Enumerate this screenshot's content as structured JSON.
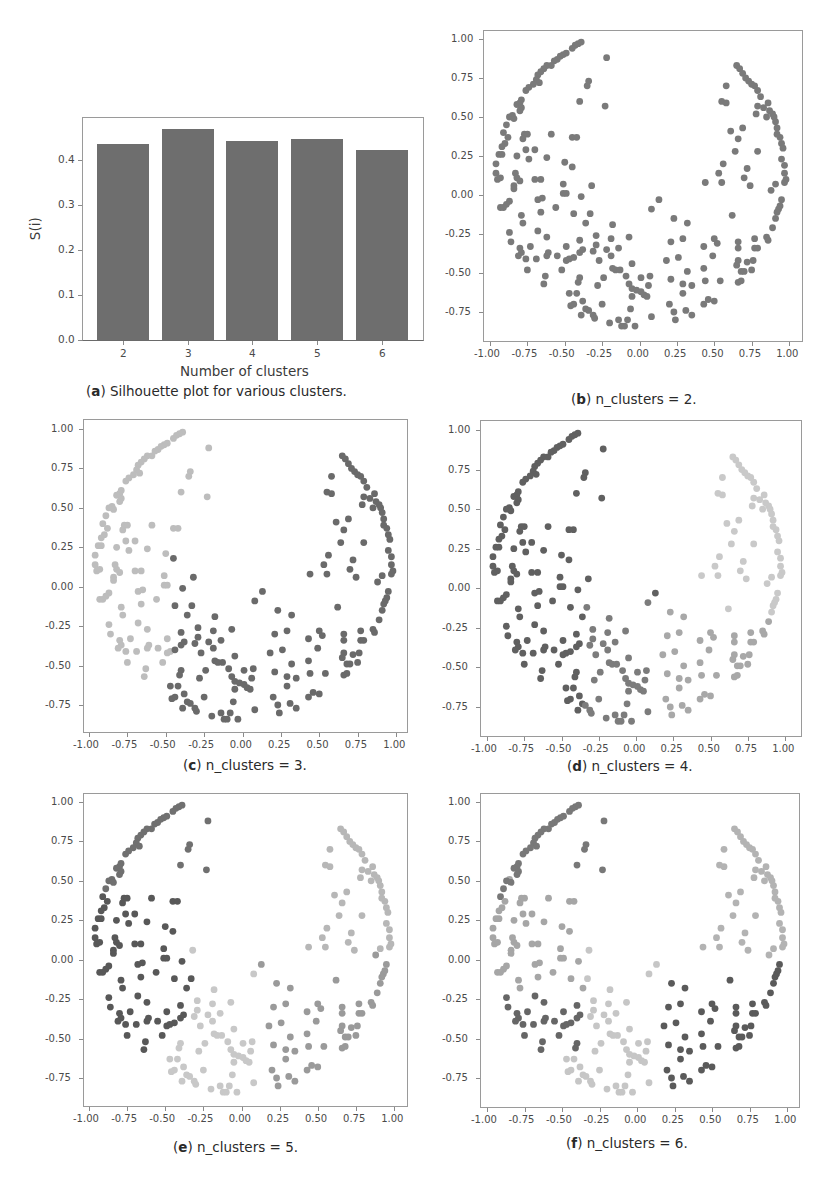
{
  "panels": {
    "a": {
      "letter": "a",
      "caption": "Silhouette plot for various clusters.",
      "ylabel": "S(i)",
      "xlabel": "Number of clusters",
      "yticks": [
        "0.0",
        "0.1",
        "0.2",
        "0.3",
        "0.4"
      ],
      "xticks": [
        "2",
        "3",
        "4",
        "5",
        "6"
      ]
    },
    "b": {
      "letter": "b",
      "caption": "n_clusters = 2."
    },
    "c": {
      "letter": "c",
      "caption": "n_clusters = 3."
    },
    "d": {
      "letter": "d",
      "caption": "n_clusters = 4."
    },
    "e": {
      "letter": "e",
      "caption": "n_clusters = 5."
    },
    "f": {
      "letter": "f",
      "caption": "n_clusters = 6."
    }
  },
  "scatter_ticks": {
    "x": [
      "-1.00",
      "-0.75",
      "-0.50",
      "-0.25",
      "0.00",
      "0.25",
      "0.50",
      "0.75",
      "1.00"
    ],
    "y": [
      "-0.75",
      "-0.50",
      "-0.25",
      "0.00",
      "0.25",
      "0.50",
      "0.75",
      "1.00"
    ]
  },
  "chart_data": [
    {
      "type": "bar",
      "title": "(a) Silhouette plot for various clusters.",
      "categories": [
        "2",
        "3",
        "4",
        "5",
        "6"
      ],
      "values": [
        0.435,
        0.47,
        0.443,
        0.447,
        0.423
      ],
      "xlabel": "Number of clusters",
      "ylabel": "S(i)",
      "ylim": [
        0,
        0.49
      ],
      "color": "#6e6e6e",
      "grid": false
    },
    {
      "type": "scatter",
      "title": "Cluster assignments of crescent-shaped dataset",
      "xlabel": "",
      "ylabel": "",
      "xlim": [
        -1.05,
        1.05
      ],
      "ylim": [
        -0.93,
        1.05
      ],
      "grid": false,
      "points": [
        [
          -0.39,
          0.98
        ],
        [
          -0.41,
          0.97
        ],
        [
          -0.43,
          0.96
        ],
        [
          -0.45,
          0.94
        ],
        [
          -0.49,
          0.91
        ],
        [
          -0.51,
          0.9
        ],
        [
          -0.53,
          0.89
        ],
        [
          -0.55,
          0.87
        ],
        [
          -0.57,
          0.86
        ],
        [
          -0.59,
          0.83
        ],
        [
          -0.62,
          0.83
        ],
        [
          -0.64,
          0.81
        ],
        [
          -0.66,
          0.79
        ],
        [
          -0.68,
          0.77
        ],
        [
          -0.69,
          0.74
        ],
        [
          -0.67,
          0.72
        ],
        [
          -0.71,
          0.71
        ],
        [
          -0.74,
          0.69
        ],
        [
          -0.76,
          0.67
        ],
        [
          -0.79,
          0.61
        ],
        [
          -0.8,
          0.59
        ],
        [
          -0.82,
          0.58
        ],
        [
          -0.79,
          0.56
        ],
        [
          -0.8,
          0.54
        ],
        [
          -0.85,
          0.51
        ],
        [
          -0.87,
          0.5
        ],
        [
          -0.84,
          0.49
        ],
        [
          -0.89,
          0.45
        ],
        [
          -0.91,
          0.4
        ],
        [
          -0.88,
          0.37
        ],
        [
          -0.9,
          0.33
        ],
        [
          -0.92,
          0.31
        ],
        [
          -0.94,
          0.26
        ],
        [
          -0.92,
          0.26
        ],
        [
          -0.96,
          0.2
        ],
        [
          -0.96,
          0.14
        ],
        [
          -0.95,
          0.1
        ],
        [
          -0.93,
          0.11
        ],
        [
          -0.34,
          0.73
        ],
        [
          -0.35,
          0.7
        ],
        [
          -0.4,
          0.6
        ],
        [
          -0.22,
          0.88
        ],
        [
          -0.23,
          0.57
        ],
        [
          -0.77,
          0.39
        ],
        [
          -0.75,
          0.39
        ],
        [
          -0.78,
          0.36
        ],
        [
          -0.59,
          0.39
        ],
        [
          -0.45,
          0.37
        ],
        [
          -0.42,
          0.37
        ],
        [
          -0.82,
          0.25
        ],
        [
          -0.76,
          0.29
        ],
        [
          -0.7,
          0.29
        ],
        [
          -0.74,
          0.23
        ],
        [
          -0.62,
          0.24
        ],
        [
          -0.5,
          0.21
        ],
        [
          -0.45,
          0.18
        ],
        [
          -0.83,
          0.14
        ],
        [
          -0.82,
          0.11
        ],
        [
          -0.8,
          0.09
        ],
        [
          -0.84,
          0.06
        ],
        [
          -0.7,
          0.1
        ],
        [
          -0.66,
          0.1
        ],
        [
          -0.51,
          0.07
        ],
        [
          -0.32,
          0.06
        ],
        [
          -0.84,
          0.04
        ],
        [
          -0.51,
          0.01
        ],
        [
          -0.49,
          0.01
        ],
        [
          -0.39,
          -0.01
        ],
        [
          -0.68,
          -0.03
        ],
        [
          -0.65,
          -0.02
        ],
        [
          -0.87,
          -0.04
        ],
        [
          -0.89,
          -0.06
        ],
        [
          -0.93,
          -0.08
        ],
        [
          -0.91,
          -0.08
        ],
        [
          -0.66,
          -0.11
        ],
        [
          -0.56,
          -0.08
        ],
        [
          -0.44,
          -0.12
        ],
        [
          -0.79,
          -0.13
        ],
        [
          -0.78,
          -0.18
        ],
        [
          -0.33,
          -0.12
        ],
        [
          -0.36,
          -0.18
        ],
        [
          -0.87,
          -0.24
        ],
        [
          -0.68,
          -0.23
        ],
        [
          -0.62,
          -0.27
        ],
        [
          -0.86,
          -0.3
        ],
        [
          -0.4,
          -0.29
        ],
        [
          -0.29,
          -0.26
        ],
        [
          -0.29,
          -0.32
        ],
        [
          -0.8,
          -0.34
        ],
        [
          -0.73,
          -0.33
        ],
        [
          -0.49,
          -0.33
        ],
        [
          -0.79,
          -0.37
        ],
        [
          -0.81,
          -0.39
        ],
        [
          -0.62,
          -0.39
        ],
        [
          -0.61,
          -0.37
        ],
        [
          -0.55,
          -0.39
        ],
        [
          -0.4,
          -0.37
        ],
        [
          -0.38,
          -0.35
        ],
        [
          -0.31,
          -0.36
        ],
        [
          -0.76,
          -0.41
        ],
        [
          -0.69,
          -0.41
        ],
        [
          -0.49,
          -0.42
        ],
        [
          -0.47,
          -0.41
        ],
        [
          -0.44,
          -0.4
        ],
        [
          -0.27,
          -0.42
        ],
        [
          -0.75,
          -0.48
        ],
        [
          -0.52,
          -0.48
        ],
        [
          -0.63,
          -0.52
        ],
        [
          -0.64,
          -0.57
        ],
        [
          -0.4,
          -0.53
        ],
        [
          -0.41,
          -0.56
        ],
        [
          -0.28,
          -0.58
        ],
        [
          -0.47,
          -0.63
        ],
        [
          -0.42,
          -0.63
        ],
        [
          -0.46,
          -0.71
        ],
        [
          -0.44,
          -0.7
        ],
        [
          -0.38,
          -0.68
        ],
        [
          -0.39,
          -0.77
        ],
        [
          -0.36,
          -0.73
        ],
        [
          -0.34,
          -0.74
        ],
        [
          -0.31,
          -0.77
        ],
        [
          -0.3,
          -0.79
        ],
        [
          -0.25,
          -0.7
        ],
        [
          -0.2,
          -0.82
        ],
        [
          -0.14,
          -0.8
        ],
        [
          -0.12,
          -0.84
        ],
        [
          -0.1,
          -0.84
        ],
        [
          -0.08,
          -0.8
        ],
        [
          -0.03,
          -0.84
        ],
        [
          -0.06,
          -0.73
        ],
        [
          0.08,
          -0.78
        ],
        [
          -0.18,
          -0.19
        ],
        [
          -0.22,
          -0.35
        ],
        [
          -0.19,
          -0.28
        ],
        [
          -0.19,
          -0.39
        ],
        [
          -0.14,
          -0.34
        ],
        [
          -0.18,
          -0.47
        ],
        [
          -0.16,
          -0.48
        ],
        [
          -0.13,
          -0.48
        ],
        [
          -0.07,
          -0.27
        ],
        [
          -0.05,
          -0.44
        ],
        [
          -0.24,
          -0.53
        ],
        [
          -0.09,
          -0.52
        ],
        [
          -0.07,
          -0.57
        ],
        [
          -0.05,
          -0.6
        ],
        [
          -0.02,
          -0.61
        ],
        [
          0.01,
          -0.62
        ],
        [
          0.03,
          -0.64
        ],
        [
          0.05,
          -0.65
        ],
        [
          -0.05,
          -0.65
        ],
        [
          0.01,
          -0.53
        ],
        [
          0.07,
          -0.52
        ],
        [
          0.06,
          -0.58
        ],
        [
          0.08,
          -0.09
        ],
        [
          0.13,
          -0.03
        ],
        [
          0.18,
          -0.42
        ],
        [
          0.21,
          -0.3
        ],
        [
          0.21,
          -0.54
        ],
        [
          0.23,
          -0.15
        ],
        [
          0.26,
          -0.4
        ],
        [
          0.29,
          -0.28
        ],
        [
          0.32,
          -0.18
        ],
        [
          0.29,
          -0.57
        ],
        [
          0.32,
          -0.49
        ],
        [
          0.2,
          -0.7
        ],
        [
          0.23,
          -0.75
        ],
        [
          0.24,
          -0.8
        ],
        [
          0.29,
          -0.63
        ],
        [
          0.31,
          -0.74
        ],
        [
          0.35,
          -0.77
        ],
        [
          0.35,
          -0.58
        ],
        [
          0.43,
          -0.33
        ],
        [
          0.43,
          -0.47
        ],
        [
          0.44,
          -0.55
        ],
        [
          0.43,
          -0.7
        ],
        [
          0.46,
          -0.67
        ],
        [
          0.5,
          -0.68
        ],
        [
          0.49,
          -0.39
        ],
        [
          0.5,
          -0.28
        ],
        [
          0.52,
          -0.31
        ],
        [
          0.54,
          -0.55
        ],
        [
          0.44,
          0.08
        ],
        [
          0.53,
          0.14
        ],
        [
          0.55,
          0.08
        ],
        [
          0.56,
          0.2
        ],
        [
          0.55,
          0.6
        ],
        [
          0.58,
          0.59
        ],
        [
          0.58,
          0.7
        ],
        [
          0.61,
          0.41
        ],
        [
          0.62,
          -0.13
        ],
        [
          0.64,
          0.28
        ],
        [
          0.66,
          0.36
        ],
        [
          0.69,
          0.43
        ],
        [
          0.7,
          0.11
        ],
        [
          0.72,
          0.17
        ],
        [
          0.74,
          0.06
        ],
        [
          0.66,
          -0.3
        ],
        [
          0.66,
          -0.34
        ],
        [
          0.66,
          -0.42
        ],
        [
          0.65,
          -0.45
        ],
        [
          0.66,
          -0.56
        ],
        [
          0.68,
          -0.55
        ],
        [
          0.68,
          -0.49
        ],
        [
          0.7,
          -0.49
        ],
        [
          0.72,
          -0.43
        ],
        [
          0.75,
          -0.48
        ],
        [
          0.76,
          -0.42
        ],
        [
          0.77,
          -0.34
        ],
        [
          0.79,
          -0.34
        ],
        [
          0.77,
          -0.28
        ],
        [
          0.79,
          0.28
        ],
        [
          0.78,
          0.52
        ],
        [
          0.79,
          0.57
        ],
        [
          0.85,
          -0.27
        ],
        [
          0.86,
          -0.29
        ],
        [
          0.89,
          -0.21
        ],
        [
          0.88,
          0.03
        ],
        [
          0.91,
          -0.15
        ],
        [
          0.92,
          -0.11
        ],
        [
          0.93,
          -0.09
        ],
        [
          0.95,
          -0.03
        ],
        [
          0.94,
          -0.07
        ],
        [
          0.91,
          0.07
        ],
        [
          0.65,
          0.83
        ],
        [
          0.67,
          0.81
        ],
        [
          0.69,
          0.78
        ],
        [
          0.71,
          0.75
        ],
        [
          0.73,
          0.73
        ],
        [
          0.75,
          0.71
        ],
        [
          0.77,
          0.7
        ],
        [
          0.79,
          0.67
        ],
        [
          0.81,
          0.63
        ],
        [
          0.83,
          0.56
        ],
        [
          0.86,
          0.59
        ],
        [
          0.87,
          0.54
        ],
        [
          0.89,
          0.52
        ],
        [
          0.9,
          0.5
        ],
        [
          0.91,
          0.47
        ],
        [
          0.92,
          0.43
        ],
        [
          0.94,
          0.37
        ],
        [
          0.95,
          0.33
        ],
        [
          0.96,
          0.3
        ],
        [
          0.95,
          0.23
        ],
        [
          0.97,
          0.19
        ],
        [
          0.97,
          0.14
        ],
        [
          0.98,
          0.1
        ],
        [
          0.97,
          0.08
        ],
        [
          0.85,
          0.5
        ],
        [
          0.92,
          0.39
        ]
      ],
      "labels_by_panel": {
        "b": "region2",
        "c": "region3",
        "d": "region4",
        "e": "region5",
        "f": "region6"
      }
    }
  ],
  "cluster_colors": {
    "b": [
      "#7a7a7a",
      "#7a7a7a"
    ],
    "c": [
      "#bdbdbd",
      "#6a6a6a"
    ],
    "d": [
      "#606060",
      "#7c7c7c",
      "#a8a8a8",
      "#c9c9c9"
    ],
    "e": [
      "#707070",
      "#585858",
      "#c8c8c8",
      "#9a9a9a",
      "#b7b7b7"
    ],
    "f": [
      "#787878",
      "#a6a6a6",
      "#666666",
      "#c6c6c6",
      "#5a5a5a",
      "#b3b3b3"
    ]
  }
}
